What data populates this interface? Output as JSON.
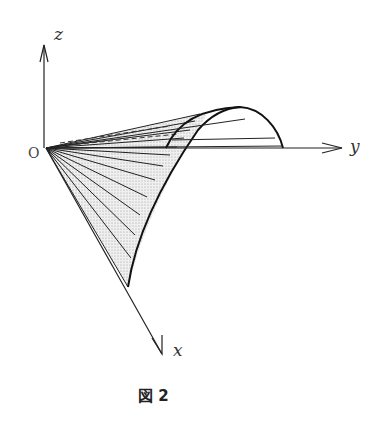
{
  "figure": {
    "caption": "図 2",
    "axes": {
      "x_label": "x",
      "y_label": "y",
      "z_label": "z",
      "origin_label": "O"
    },
    "colors": {
      "ink": "#222222",
      "shade": "#dcdcdc"
    }
  }
}
